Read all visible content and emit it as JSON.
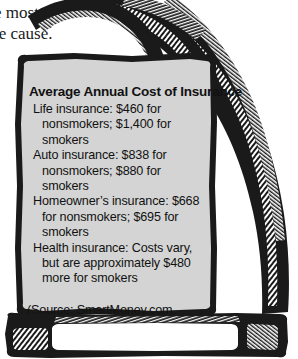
{
  "bodycopy": {
    "line1": "e most",
    "line2": "le cause."
  },
  "sign": {
    "title": "Average Annual Cost of Insurance",
    "items": [
      "Life insurance: $460 for nonsmokers; $1,400 for smokers",
      "Auto insurance: $838 for nonsmokers; $880 for smokers",
      "Homeowner’s insurance: $668 for nonsmokers; $695 for smokers",
      "Health insurance: Costs vary, but are approximately $480 more for smokers"
    ],
    "source": "(Source: SmartMoney.com, 2007)"
  },
  "illustration": {
    "hand_icon": "hand-holding-sign-icon",
    "slot_icon": "ballot-box-slot-icon"
  },
  "colors": {
    "ink": "#111111",
    "sign_fill": "#d4d4d4",
    "page_background": "#ffffff"
  }
}
